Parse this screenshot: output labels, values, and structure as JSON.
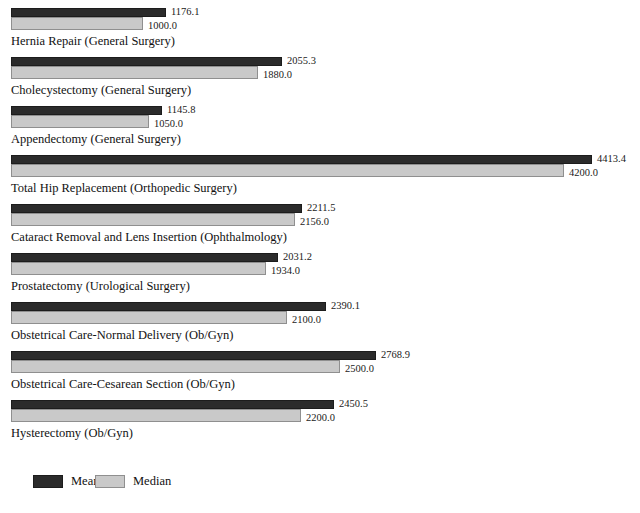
{
  "chart_data": {
    "type": "bar",
    "orientation": "horizontal",
    "title": "",
    "xlabel": "",
    "ylabel": "",
    "grid": false,
    "legend_position": "bottom-left",
    "xlim": [
      0,
      4413.4
    ],
    "categories": [
      "Hernia Repair (General Surgery)",
      "Cholecystectomy (General Surgery)",
      "Appendectomy (General Surgery)",
      "Total Hip Replacement (Orthopedic Surgery)",
      "Cataract Removal and Lens Insertion (Ophthalmology)",
      "Prostatectomy (Urological Surgery)",
      "Obstetrical Care-Normal Delivery (Ob/Gyn)",
      "Obstetrical Care-Cesarean Section (Ob/Gyn)",
      "Hysterectomy (Ob/Gyn)"
    ],
    "series": [
      {
        "name": "Mean",
        "color": "#2b2b2b",
        "values": [
          1176.1,
          2055.3,
          1145.8,
          4413.4,
          2211.5,
          2031.2,
          2390.1,
          2768.9,
          2450.5
        ],
        "labels": [
          "1176.1",
          "2055.3",
          "1145.8",
          "4413.4",
          "2211.5",
          "2031.2",
          "2390.1",
          "2768.9",
          "2450.5"
        ]
      },
      {
        "name": "Median",
        "color": "#c9c9c9",
        "values": [
          1000.0,
          1880.0,
          1050.0,
          4200.0,
          2156.0,
          1934.0,
          2100.0,
          2500.0,
          2200.0
        ],
        "labels": [
          "1000.0",
          "1880.0",
          "1050.0",
          "4200.0",
          "2156.0",
          "1934.0",
          "2100.0",
          "2500.0",
          "2200.0"
        ]
      }
    ]
  },
  "legend": {
    "items": [
      {
        "label": "Mean",
        "swatch": "mean"
      },
      {
        "label": "Median",
        "swatch": "median"
      }
    ]
  }
}
